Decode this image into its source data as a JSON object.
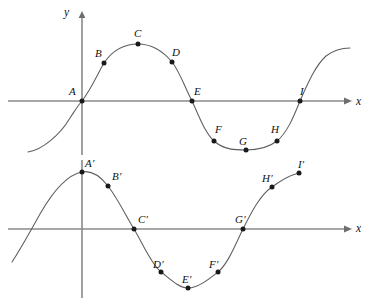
{
  "figure": {
    "background_color": "#ffffff",
    "curve_color": "#5d5d5d",
    "axis_color": "#8a8a8a",
    "point_color": "#1a1a1a",
    "width": 376,
    "height": 307
  },
  "upper_graph": {
    "name": "upper-graph",
    "axis_x_label": "x",
    "axis_y_label": "y",
    "origin": {
      "x": 82,
      "y": 101
    },
    "axis_x": {
      "x1": 8,
      "y1": 101,
      "x2": 348,
      "y2": 101
    },
    "axis_y": {
      "x1": 82,
      "y1": 14,
      "x2": 82,
      "y2": 155
    },
    "x_label_pos": {
      "x": 356,
      "y": 96
    },
    "y_label_pos": {
      "x": 64,
      "y": 7
    },
    "points": [
      {
        "label": "A",
        "cx": 82,
        "cy": 101,
        "lx": 69,
        "ly": 86
      },
      {
        "label": "B",
        "cx": 104,
        "cy": 63,
        "lx": 95,
        "ly": 48
      },
      {
        "label": "C",
        "cx": 138,
        "cy": 44,
        "lx": 134,
        "ly": 28
      },
      {
        "label": "D",
        "cx": 172,
        "cy": 62,
        "lx": 172,
        "ly": 47
      },
      {
        "label": "E",
        "cx": 192,
        "cy": 101,
        "lx": 194,
        "ly": 86
      },
      {
        "label": "F",
        "cx": 214,
        "cy": 141,
        "lx": 215,
        "ly": 124
      },
      {
        "label": "G",
        "cx": 246,
        "cy": 150,
        "lx": 239,
        "ly": 142
      },
      {
        "label": "H",
        "cx": 277,
        "cy": 141,
        "lx": 271,
        "ly": 124
      },
      {
        "label": "I",
        "cx": 300,
        "cy": 101,
        "lx": 300,
        "ly": 86
      }
    ]
  },
  "lower_graph": {
    "name": "lower-graph",
    "axis_x_label": "x",
    "origin": {
      "x": 82,
      "y": 229
    },
    "axis_x": {
      "x1": 8,
      "y1": 229,
      "x2": 348,
      "y2": 229
    },
    "axis_y": {
      "x1": 82,
      "y1": 160,
      "x2": 82,
      "y2": 298
    },
    "x_label_pos": {
      "x": 356,
      "y": 223
    },
    "points": [
      {
        "label": "A′",
        "cx": 82,
        "cy": 172,
        "lx": 85,
        "ly": 158
      },
      {
        "label": "B′",
        "cx": 108,
        "cy": 186,
        "lx": 112,
        "ly": 171
      },
      {
        "label": "C′",
        "cx": 134,
        "cy": 229,
        "lx": 138,
        "ly": 214
      },
      {
        "label": "D′",
        "cx": 161,
        "cy": 272,
        "lx": 153,
        "ly": 259
      },
      {
        "label": "E′",
        "cx": 188,
        "cy": 288,
        "lx": 182,
        "ly": 274
      },
      {
        "label": "F′",
        "cx": 218,
        "cy": 272,
        "lx": 209,
        "ly": 259
      },
      {
        "label": "G′",
        "cx": 243,
        "cy": 229,
        "lx": 235,
        "ly": 214
      },
      {
        "label": "H′",
        "cx": 272,
        "cy": 187,
        "lx": 262,
        "ly": 173
      },
      {
        "label": "I′",
        "cx": 299,
        "cy": 173,
        "lx": 298,
        "ly": 159
      }
    ]
  }
}
